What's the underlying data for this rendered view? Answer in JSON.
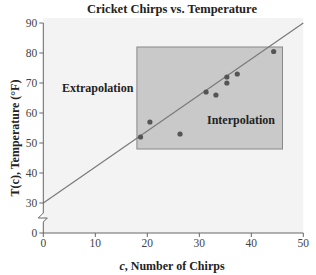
{
  "chart_data": {
    "type": "scatter",
    "title": "Cricket Chirps vs. Temperature",
    "xlabel": "c, Number of Chirps",
    "ylabel": "T(c), Temperature (°F)",
    "xlim": [
      0,
      50
    ],
    "ylim": [
      0,
      90
    ],
    "y_axis_break": [
      0,
      30
    ],
    "x_ticks": [
      0,
      10,
      20,
      30,
      40,
      50
    ],
    "y_ticks": [
      0,
      30,
      40,
      50,
      60,
      70,
      80,
      90
    ],
    "grid": false,
    "legend": null,
    "series": [
      {
        "name": "Observed data",
        "type": "scatter",
        "points": [
          {
            "x": 18.7,
            "y": 52
          },
          {
            "x": 20.5,
            "y": 57
          },
          {
            "x": 26.3,
            "y": 53
          },
          {
            "x": 31.3,
            "y": 67
          },
          {
            "x": 33.2,
            "y": 66
          },
          {
            "x": 35.3,
            "y": 72
          },
          {
            "x": 35.3,
            "y": 70
          },
          {
            "x": 37.3,
            "y": 73
          },
          {
            "x": 44.3,
            "y": 80.5
          }
        ],
        "color": "#555555"
      },
      {
        "name": "Fitted line T(c) = 1.2c + 30",
        "type": "line",
        "points": [
          {
            "x": 0,
            "y": 30
          },
          {
            "x": 50,
            "y": 90
          }
        ],
        "color": "#777777"
      }
    ],
    "regions": [
      {
        "label": "Interpolation",
        "x_range": [
          18,
          46
        ],
        "y_range": [
          48,
          82
        ],
        "fill": "#c9c9c9",
        "stroke": "#888888"
      }
    ],
    "annotations": [
      {
        "text": "Extrapolation",
        "x": 4,
        "y": 70
      },
      {
        "text": "Interpolation",
        "x": 32,
        "y": 59
      }
    ]
  },
  "labels": {
    "title": "Cricket Chirps vs. Temperature",
    "x_axis_italic": "c",
    "x_axis_rest": ", Number of Chirps",
    "y_axis": "T(c), Temperature (°F)",
    "extrapolation": "Extrapolation",
    "interpolation": "Interpolation"
  },
  "colors": {
    "plot_bg": "#f3f3f3",
    "box_fill": "#c9c9c9",
    "box_stroke": "#8a8a8a",
    "line": "#7a7a7a",
    "dot": "#555555",
    "axis": "#666666"
  }
}
